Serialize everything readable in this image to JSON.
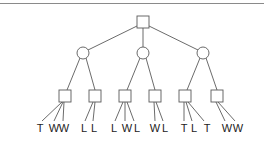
{
  "diagram": {
    "type": "game-tree",
    "root": {
      "shape": "square",
      "x": 143,
      "y": 22
    },
    "level1": [
      {
        "shape": "circle",
        "x": 83,
        "y": 53
      },
      {
        "shape": "circle",
        "x": 143,
        "y": 53
      },
      {
        "shape": "circle",
        "x": 203,
        "y": 53
      }
    ],
    "level2": [
      {
        "shape": "square",
        "x": 65,
        "y": 96,
        "parent": 0,
        "leaves": [
          {
            "x": 40,
            "label": "T"
          },
          {
            "x": 54,
            "label": "W"
          },
          {
            "x": 64,
            "label": "W"
          }
        ]
      },
      {
        "shape": "square",
        "x": 95,
        "y": 96,
        "parent": 0,
        "leaves": [
          {
            "x": 84,
            "label": "L"
          },
          {
            "x": 94,
            "label": "L"
          }
        ]
      },
      {
        "shape": "square",
        "x": 125,
        "y": 96,
        "parent": 1,
        "leaves": [
          {
            "x": 114,
            "label": "L"
          },
          {
            "x": 127,
            "label": "W"
          },
          {
            "x": 137,
            "label": "L"
          }
        ]
      },
      {
        "shape": "square",
        "x": 155,
        "y": 96,
        "parent": 1,
        "leaves": [
          {
            "x": 155,
            "label": "W"
          },
          {
            "x": 165,
            "label": "L"
          }
        ]
      },
      {
        "shape": "square",
        "x": 185,
        "y": 96,
        "parent": 2,
        "leaves": [
          {
            "x": 184,
            "label": "T"
          },
          {
            "x": 194,
            "label": "L"
          },
          {
            "x": 207,
            "label": "T"
          }
        ]
      },
      {
        "shape": "square",
        "x": 217,
        "y": 96,
        "parent": 2,
        "leaves": [
          {
            "x": 227,
            "label": "W"
          },
          {
            "x": 238,
            "label": "W"
          }
        ]
      }
    ],
    "leaf_label_y": 128,
    "leaf_labels": [
      "T",
      "W",
      "W",
      "L",
      "L",
      "L",
      "W",
      "L",
      "W",
      "L",
      "T",
      "L",
      "T",
      "W",
      "W"
    ]
  },
  "colors": {
    "stroke": "#5a5a5a",
    "text": "#222222",
    "border": "#8a8a8a"
  }
}
